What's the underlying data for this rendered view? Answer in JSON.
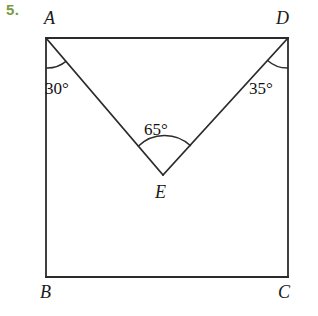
{
  "problem": {
    "number": "5.",
    "number_color": "#7a9a45"
  },
  "figure": {
    "stroke_color": "#2b2b2b",
    "background_color": "#ffffff",
    "vertices": [
      {
        "name": "A",
        "label": "A",
        "x": 46,
        "y": 38
      },
      {
        "name": "D",
        "label": "D",
        "x": 288,
        "y": 38
      },
      {
        "name": "B",
        "label": "B",
        "x": 46,
        "y": 277
      },
      {
        "name": "C",
        "label": "C",
        "x": 288,
        "y": 277
      },
      {
        "name": "E",
        "label": "E",
        "x": 163,
        "y": 175
      }
    ],
    "segments": [
      {
        "name": "AB",
        "from": "A",
        "to": "B"
      },
      {
        "name": "BC",
        "from": "B",
        "to": "C"
      },
      {
        "name": "CD",
        "from": "C",
        "to": "D"
      },
      {
        "name": "DA",
        "from": "D",
        "to": "A"
      },
      {
        "name": "AE",
        "from": "A",
        "to": "E"
      },
      {
        "name": "ED",
        "from": "E",
        "to": "D"
      }
    ],
    "angles": [
      {
        "name": "angle-BAE",
        "vertex": "A",
        "label": "30°",
        "value": 30
      },
      {
        "name": "angle-EDC",
        "vertex": "D",
        "label": "35°",
        "value": 35
      },
      {
        "name": "angle-AED",
        "vertex": "E",
        "label": "65°",
        "value": 65
      }
    ]
  }
}
